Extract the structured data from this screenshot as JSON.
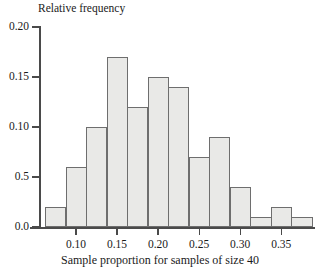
{
  "chart_data": {
    "type": "bar",
    "title": "",
    "ylabel": "Relative frequency",
    "xlabel": "Sample proportion for samples of size 40",
    "grid": false,
    "legend": null,
    "bin_width": 0.025,
    "bin_start": 0.0625,
    "xlim": [
      0.055,
      0.3875
    ],
    "ylim": [
      0.0,
      0.2
    ],
    "ytick_labels": [
      "0.20",
      "0.15",
      "0.10",
      "0.5",
      "0.0"
    ],
    "ytick_values": [
      0.2,
      0.15,
      0.1,
      0.05,
      0.0
    ],
    "xtick_labels": [
      "0.10",
      "0.15",
      "0.20",
      "0.25",
      "0.30",
      "0.35"
    ],
    "xtick_values": [
      0.1,
      0.15,
      0.2,
      0.25,
      0.3,
      0.35
    ],
    "bin_edges": [
      0.0625,
      0.0875,
      0.1125,
      0.1375,
      0.1625,
      0.1875,
      0.2125,
      0.2375,
      0.2625,
      0.2875,
      0.3125,
      0.3375,
      0.3625,
      0.3875
    ],
    "categories": [
      "0.0625-0.0875",
      "0.0875-0.1125",
      "0.1125-0.1375",
      "0.1375-0.1625",
      "0.1625-0.1875",
      "0.1875-0.2125",
      "0.2125-0.2375",
      "0.2375-0.2625",
      "0.2625-0.2875",
      "0.2875-0.3125",
      "0.3125-0.3375",
      "0.3375-0.3625",
      "0.3625-0.3875"
    ],
    "values": [
      0.02,
      0.06,
      0.1,
      0.17,
      0.12,
      0.15,
      0.14,
      0.07,
      0.09,
      0.04,
      0.01,
      0.02,
      0.01
    ],
    "bar_fill_color": "#e9e9e7",
    "bar_edge_color": "#6e6e6e",
    "axis_color": "#4a4a4a"
  }
}
